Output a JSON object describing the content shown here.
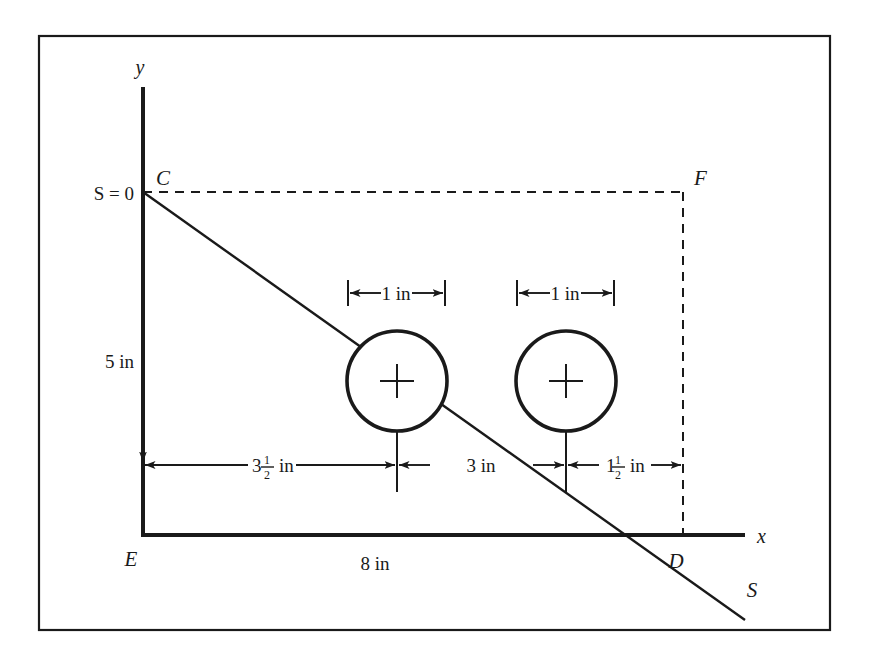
{
  "figure": {
    "background_color": "#ffffff",
    "line_color": "#1a1a1a",
    "border": {
      "x": 39,
      "y": 36,
      "width": 791,
      "height": 594
    }
  },
  "axes": {
    "y_label": "y",
    "x_label": "x",
    "origin_label": "E",
    "y_axis": {
      "x": 143,
      "top": 87,
      "bottom": 535
    },
    "x_axis": {
      "y": 535,
      "left": 143,
      "right": 745
    }
  },
  "points": [
    {
      "name": "C",
      "label": "C",
      "x": 143,
      "y": 192
    },
    {
      "name": "F",
      "label": "F",
      "x": 683,
      "y": 192
    },
    {
      "name": "E",
      "label": "E",
      "x": 143,
      "y": 535
    },
    {
      "name": "D",
      "label": "D",
      "x": 683,
      "y": 535
    },
    {
      "name": "S",
      "label": "S",
      "x": 745,
      "y": 578
    }
  ],
  "labels": {
    "s_zero": "S = 0",
    "height_left": "5 in",
    "span_bottom": "8 in",
    "line_end": "S"
  },
  "dimensions": [
    {
      "name": "circle-1-diameter",
      "text": "1 in",
      "from_x": 348,
      "to_x": 445,
      "y": 293
    },
    {
      "name": "circle-2-diameter",
      "text": "1 in",
      "from_x": 517,
      "to_x": 614,
      "y": 293
    },
    {
      "name": "left-offset",
      "whole": "3",
      "numerator": "1",
      "denominator": "2",
      "unit": "in",
      "from_x": 143,
      "to_x": 397,
      "y": 465
    },
    {
      "name": "circle-spacing",
      "text": "3 in",
      "from_x": 397,
      "to_x": 566,
      "y": 465
    },
    {
      "name": "right-offset",
      "whole": "1",
      "numerator": "1",
      "denominator": "2",
      "unit": "in",
      "from_x": 566,
      "to_x": 683,
      "y": 465
    }
  ],
  "circles": [
    {
      "name": "roller-1",
      "cx": 397,
      "cy": 381,
      "r": 50,
      "stroke_width": 3.5
    },
    {
      "name": "roller-2",
      "cx": 566,
      "cy": 381,
      "r": 50,
      "stroke_width": 3.5
    }
  ],
  "load_line": {
    "name": "shear-line-S",
    "from": {
      "x": 143,
      "y": 192
    },
    "to": {
      "x": 745,
      "y": 620
    }
  },
  "dashed_lines": [
    {
      "name": "top-dashed-CF",
      "x1": 143,
      "y1": 192,
      "x2": 683,
      "y2": 192
    },
    {
      "name": "right-dashed-FD",
      "x1": 683,
      "y1": 192,
      "x2": 683,
      "y2": 535
    }
  ]
}
